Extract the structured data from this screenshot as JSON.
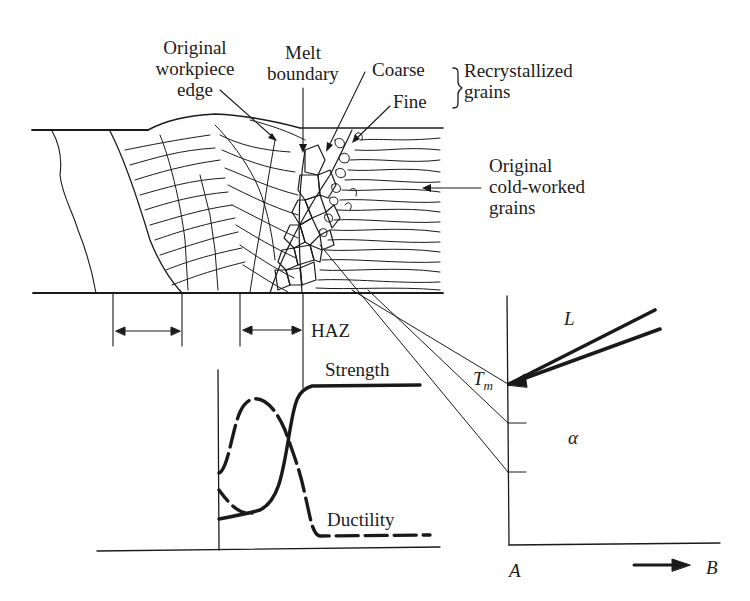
{
  "figure": {
    "type": "weld microstructure and property diagram",
    "labels": {
      "original_workpiece_edge": [
        "Original",
        "workpiece",
        "edge"
      ],
      "melt_boundary": [
        "Melt",
        "boundary"
      ],
      "coarse": "Coarse",
      "fine": "Fine",
      "recrystallized_grains": [
        "Recrystallized",
        "grains"
      ],
      "original_cold_worked_grains": [
        "Original",
        "cold-worked",
        "grains"
      ],
      "haz": "HAZ",
      "strength": "Strength",
      "ductility": "Ductility"
    },
    "phase_diagram": {
      "liquid_label": "L",
      "tm_label": "T",
      "tm_subscript": "m",
      "alpha_label": "α",
      "component_a": "A",
      "component_b": "B"
    },
    "colors": {
      "ink": "#1a1a1a",
      "background": "#ffffff"
    }
  }
}
